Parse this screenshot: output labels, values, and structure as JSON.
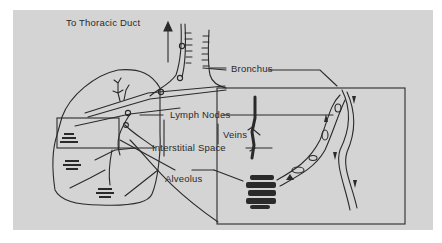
{
  "figure": {
    "background_color": "#d4d4d4",
    "line_color": "#2a2a2a",
    "labels": {
      "thoracic_duct": "To Thoracic Duct",
      "bronchus": "Bronchus",
      "lymph_nodes": "Lymph Nodes",
      "veins": "Veins",
      "interstitial_space": "Interstitial Space",
      "alveolus": "Alveolus"
    },
    "regions": [
      {
        "name": "lung-outline"
      },
      {
        "name": "trachea-bronchus"
      },
      {
        "name": "magnified-inset"
      },
      {
        "name": "lung-detail-box"
      }
    ]
  }
}
